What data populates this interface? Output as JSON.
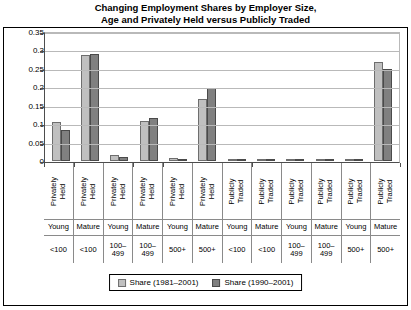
{
  "title_lines": [
    "Changing Employment Shares by Employer Size,",
    "Age and Privately Held versus Publicly Traded"
  ],
  "legend": {
    "position": "bottom",
    "items": [
      {
        "label": "Share (1981–2001)",
        "color": "#c0c0c0"
      },
      {
        "label": "Share (1990–2001)",
        "color": "#808080"
      }
    ]
  },
  "chart_data": {
    "type": "bar",
    "title": "Changing Employment Shares by Employer Size, Age and Privately Held versus Publicly Traded",
    "xlabel": "",
    "ylabel": "",
    "ylim": [
      0,
      0.35
    ],
    "yticks": [
      "0",
      "0.05",
      "0.1",
      "0.15",
      "0.2",
      "0.25",
      "0.3",
      "0.35"
    ],
    "ytick_values": [
      0,
      0.05,
      0.1,
      0.15,
      0.2,
      0.25,
      0.3,
      0.35
    ],
    "grid": true,
    "categories": [
      {
        "ownership": "Privately Held",
        "age": "Young",
        "size": "<100"
      },
      {
        "ownership": "Privately Held",
        "age": "Mature",
        "size": "<100"
      },
      {
        "ownership": "Privately Held",
        "age": "Young",
        "size": "100–499"
      },
      {
        "ownership": "Privately Held",
        "age": "Mature",
        "size": "100–499"
      },
      {
        "ownership": "Privately Held",
        "age": "Young",
        "size": "500+"
      },
      {
        "ownership": "Privately Held",
        "age": "Mature",
        "size": "500+"
      },
      {
        "ownership": "Publicly Traded",
        "age": "Young",
        "size": "<100"
      },
      {
        "ownership": "Publicly Traded",
        "age": "Mature",
        "size": "<100"
      },
      {
        "ownership": "Publicly Traded",
        "age": "Young",
        "size": "100–499"
      },
      {
        "ownership": "Publicly Traded",
        "age": "Mature",
        "size": "100–499"
      },
      {
        "ownership": "Publicly Traded",
        "age": "Young",
        "size": "500+"
      },
      {
        "ownership": "Publicly Traded",
        "age": "Mature",
        "size": "500+"
      }
    ],
    "series": [
      {
        "name": "Share (1981–2001)",
        "color": "#c0c0c0",
        "values": [
          0.105,
          0.288,
          0.017,
          0.108,
          0.008,
          0.167,
          0.0,
          0.0,
          0.0,
          0.004,
          0.0,
          0.27
        ]
      },
      {
        "name": "Share (1990–2001)",
        "color": "#808080",
        "values": [
          0.084,
          0.29,
          0.01,
          0.116,
          0.005,
          0.199,
          0.0,
          0.0,
          0.0,
          0.004,
          0.0,
          0.251
        ]
      }
    ]
  }
}
